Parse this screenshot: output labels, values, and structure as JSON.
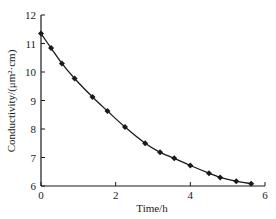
{
  "chart_data": {
    "type": "line",
    "title": "",
    "xlabel": "Time/h",
    "ylabel": "Conductivity/(μm²·cm)",
    "xlim": [
      0,
      6
    ],
    "ylim": [
      6,
      12
    ],
    "xticks": [
      0,
      2,
      4,
      6
    ],
    "yticks": [
      6,
      7,
      8,
      9,
      10,
      11,
      12
    ],
    "grid": false,
    "legend": null,
    "marker": "diamond",
    "series": [
      {
        "name": "Conductivity",
        "x": [
          0,
          0.27,
          0.56,
          0.9,
          1.38,
          1.78,
          2.25,
          2.79,
          3.19,
          3.57,
          4.0,
          4.5,
          4.8,
          5.23,
          5.63
        ],
        "values": [
          11.35,
          10.84,
          10.3,
          9.77,
          9.12,
          8.63,
          8.07,
          7.5,
          7.18,
          6.97,
          6.72,
          6.45,
          6.3,
          6.17,
          6.08
        ]
      }
    ]
  },
  "style": {
    "line_color": "#1a1a1a",
    "axis_color": "#1a1a1a"
  }
}
